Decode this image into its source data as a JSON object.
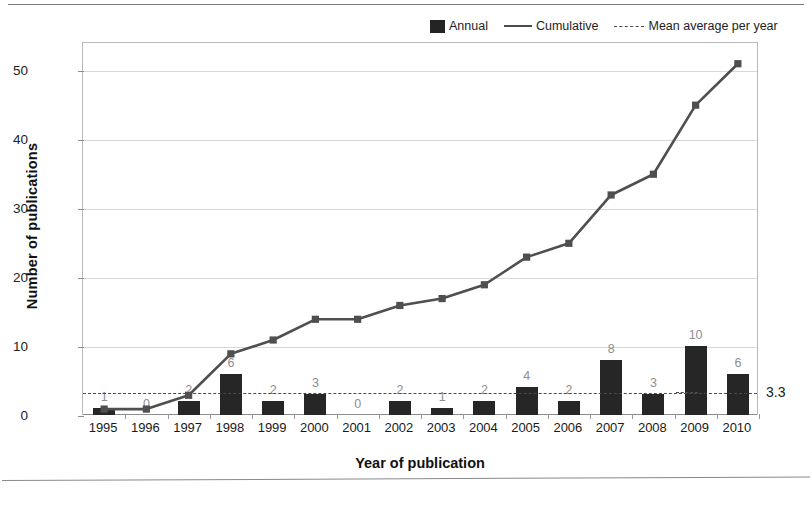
{
  "chart_data": {
    "type": "bar",
    "title": "",
    "xlabel": "Year of publication",
    "ylabel": "Number of publications",
    "categories": [
      "1995",
      "1996",
      "1997",
      "1998",
      "1999",
      "2000",
      "2001",
      "2002",
      "2003",
      "2004",
      "2005",
      "2006",
      "2007",
      "2008",
      "2009",
      "2010"
    ],
    "series": [
      {
        "name": "Annual",
        "type": "bar",
        "values": [
          1,
          0,
          2,
          6,
          2,
          3,
          0,
          2,
          1,
          2,
          4,
          2,
          8,
          3,
          10,
          6
        ],
        "color": "#262626",
        "show_labels": true
      },
      {
        "name": "Cumulative",
        "type": "line",
        "values": [
          1,
          1,
          3,
          9,
          11,
          14,
          14,
          16,
          17,
          19,
          23,
          25,
          32,
          35,
          45,
          51
        ],
        "color": "#4f4f4f",
        "show_labels": false
      }
    ],
    "reference_line": {
      "name": "Mean average per year",
      "value": 3.3,
      "label": "3.3",
      "style": "dashed",
      "color": "#4a4a4a"
    },
    "ylim": [
      0,
      54
    ],
    "yticks": [
      0,
      10,
      20,
      30,
      40,
      50
    ],
    "ytick_labels": [
      "0",
      "10",
      "20",
      "30",
      "40",
      "50"
    ],
    "grid": true,
    "legend_position": "top-right"
  },
  "legend": {
    "items": [
      {
        "label": "Annual",
        "marker": "swatch"
      },
      {
        "label": "Cumulative",
        "marker": "line"
      },
      {
        "label": "Mean average per year",
        "marker": "dashed-line"
      }
    ]
  }
}
